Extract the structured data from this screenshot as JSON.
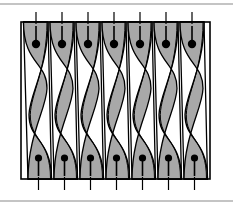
{
  "figure": {
    "name": "twisted-band-array-diagram",
    "background_color": "#ffffff",
    "stroke_color": "#000000",
    "fill_color": "#a8a8a8",
    "rule_color": "#8a8a8a"
  },
  "page_rules": {
    "top_rule": {
      "y": 4,
      "x1": 0,
      "x2": 233,
      "thickness": 1.2
    },
    "bottom_rule": {
      "y": 201,
      "x1": 0,
      "x2": 233,
      "thickness": 1.2
    }
  },
  "frame": {
    "name": "outer-frame",
    "x": 21,
    "y": 22,
    "width": 189,
    "height": 157,
    "stroke_width": 1.6,
    "fill": "none"
  },
  "cells": {
    "count": 7,
    "top_y": 22,
    "bottom_y": 179,
    "fill": "#a8a8a8",
    "stroke_width": 1.3,
    "items": [
      {
        "index": 1,
        "label": "cell-1",
        "top_left": 23.5,
        "top_right": 48.0,
        "bottom_left": 28.0,
        "bottom_right": 51.5,
        "waist_left": 25.0,
        "waist_right": 49.5,
        "pin_top_x": 36.0,
        "pin_bottom_x": 38.5,
        "tick_top_x": 36.0,
        "tick_bottom_x": 38.5
      },
      {
        "index": 2,
        "label": "cell-2",
        "top_left": 50.0,
        "top_right": 74.0,
        "bottom_left": 54.0,
        "bottom_right": 77.5,
        "waist_left": 51.5,
        "waist_right": 75.5,
        "pin_top_x": 62.0,
        "pin_bottom_x": 64.5,
        "tick_top_x": 62.0,
        "tick_bottom_x": 64.5
      },
      {
        "index": 3,
        "label": "cell-3",
        "top_left": 76.0,
        "top_right": 100.0,
        "bottom_left": 80.0,
        "bottom_right": 103.5,
        "waist_left": 77.5,
        "waist_right": 101.5,
        "pin_top_x": 88.0,
        "pin_bottom_x": 90.5,
        "tick_top_x": 88.0,
        "tick_bottom_x": 90.5
      },
      {
        "index": 4,
        "label": "cell-4",
        "top_left": 102.0,
        "top_right": 126.0,
        "bottom_left": 106.0,
        "bottom_right": 129.5,
        "waist_left": 103.5,
        "waist_right": 127.5,
        "pin_top_x": 114.0,
        "pin_bottom_x": 116.5,
        "tick_top_x": 114.0,
        "tick_bottom_x": 116.5
      },
      {
        "index": 5,
        "label": "cell-5",
        "top_left": 128.0,
        "top_right": 152.0,
        "bottom_left": 132.0,
        "bottom_right": 155.5,
        "waist_left": 129.5,
        "waist_right": 153.5,
        "pin_top_x": 140.0,
        "pin_bottom_x": 142.5,
        "tick_top_x": 140.0,
        "tick_bottom_x": 142.5
      },
      {
        "index": 6,
        "label": "cell-6",
        "top_left": 154.0,
        "top_right": 178.0,
        "bottom_left": 158.0,
        "bottom_right": 181.5,
        "waist_left": 155.5,
        "waist_right": 179.5,
        "pin_top_x": 166.0,
        "pin_bottom_x": 168.5,
        "tick_top_x": 166.0,
        "tick_bottom_x": 168.5
      },
      {
        "index": 7,
        "label": "cell-7",
        "top_left": 180.0,
        "top_right": 204.0,
        "bottom_left": 184.0,
        "bottom_right": 207.5,
        "waist_left": 181.5,
        "waist_right": 205.5,
        "pin_top_x": 192.0,
        "pin_bottom_x": 194.5,
        "tick_top_x": 192.0,
        "tick_bottom_x": 194.5
      }
    ]
  },
  "markers": {
    "pin_top": {
      "name": "pin-marker-top",
      "dot_cy": 44,
      "dot_r": 4.2,
      "stem_y1": 26,
      "stem_y2": 44,
      "color": "#000000"
    },
    "pin_bottom": {
      "name": "pin-marker-bottom",
      "dot_cy": 158,
      "dot_r": 3.6,
      "stem_y1": 158,
      "stem_y2": 176,
      "color": "#000000"
    },
    "tick_top": {
      "name": "tick-mark-top",
      "y1": 12,
      "y2": 24,
      "width": 1.2
    },
    "tick_bottom": {
      "name": "tick-mark-bottom",
      "y1": 177,
      "y2": 190,
      "width": 1.2
    }
  }
}
